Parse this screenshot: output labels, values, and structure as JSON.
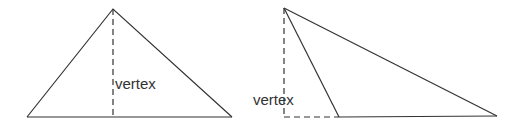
{
  "figures": [
    {
      "name": "acute-triangle",
      "label": "vertex"
    },
    {
      "name": "obtuse-triangle",
      "label": "vertex"
    }
  ],
  "colors": {
    "stroke": "#333333",
    "background": "#ffffff"
  }
}
